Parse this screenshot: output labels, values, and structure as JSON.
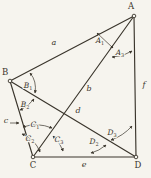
{
  "diagram": {
    "ink": "#3a352c",
    "paper": "#f6f4ee",
    "vertices": [
      {
        "name": "A",
        "x": 134,
        "y": 16,
        "lx": 131,
        "ly": 9
      },
      {
        "name": "B",
        "x": 10,
        "y": 81,
        "lx": 5,
        "ly": 75
      },
      {
        "name": "C",
        "x": 33,
        "y": 157,
        "lx": 33,
        "ly": 168
      },
      {
        "name": "D",
        "x": 136,
        "y": 157,
        "lx": 138,
        "ly": 168
      }
    ],
    "edges": [
      {
        "label": "a",
        "from": "B",
        "to": "A",
        "lx": 54,
        "ly": 45
      },
      {
        "label": "b",
        "from": "C",
        "to": "A",
        "lx": 89,
        "ly": 91
      },
      {
        "label": "c",
        "from": "B",
        "to": "C",
        "lx": 6,
        "ly": 123
      },
      {
        "label": "d",
        "from": "B",
        "to": "D",
        "lx": 78,
        "ly": 113
      },
      {
        "label": "e",
        "from": "C",
        "to": "D",
        "lx": 84,
        "ly": 167
      },
      {
        "label": "f",
        "from": "A",
        "to": "D",
        "lx": 144,
        "ly": 87
      }
    ],
    "angles": [
      {
        "letter": "A",
        "sub": "1",
        "x": 100,
        "y": 43
      },
      {
        "letter": "A",
        "sub": "3",
        "x": 120,
        "y": 55
      },
      {
        "letter": "B",
        "sub": "1",
        "x": 28,
        "y": 88
      },
      {
        "letter": "B",
        "sub": "2",
        "x": 25,
        "y": 107
      },
      {
        "letter": "C",
        "sub": "1",
        "x": 35,
        "y": 127
      },
      {
        "letter": "C",
        "sub": "2",
        "x": 30,
        "y": 141
      },
      {
        "letter": "C",
        "sub": "3",
        "x": 59,
        "y": 142
      },
      {
        "letter": "D",
        "sub": "2",
        "x": 94,
        "y": 144
      },
      {
        "letter": "D",
        "sub": "3",
        "x": 112,
        "y": 135
      }
    ],
    "arcs": [
      {
        "for": "A1",
        "d": "M 97,33 C 102,38 108,43 113,48",
        "s": true,
        "e": true
      },
      {
        "for": "A3",
        "d": "M 112,57 Q 123,57 132,51",
        "s": true,
        "e": true
      },
      {
        "for": "B1",
        "d": "M 30,73 Q 37,81 35,93",
        "s": true,
        "e": true
      },
      {
        "for": "B2",
        "d": "M 34,99 Q 28,107 20,110",
        "s": true,
        "e": true
      },
      {
        "for": "c-pointer",
        "d": "M 10,123 L 19,123",
        "s": false,
        "e": true
      },
      {
        "for": "C1",
        "d": "M 23,127 Q 37,122 52,128",
        "s": true,
        "e": true
      },
      {
        "for": "C2",
        "d": "M 22,134 Q 35,139 40,152",
        "s": true,
        "e": true
      },
      {
        "for": "C3",
        "d": "M 53,136 Q 61,144 63,151",
        "s": true,
        "e": true
      },
      {
        "for": "D2",
        "d": "M 91,153 Q 99,151 106,145",
        "s": true,
        "e": true
      },
      {
        "for": "D3",
        "d": "M 111,140 Q 123,136 132,126",
        "s": true,
        "e": true
      }
    ]
  }
}
